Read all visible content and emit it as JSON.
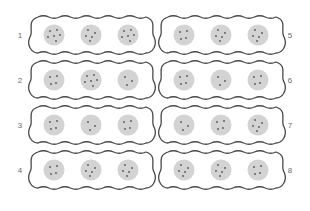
{
  "diagram": {
    "colors": {
      "outline": "#4a4a4a",
      "circle_fill": "#d3d3d3",
      "dot": "#555555",
      "label": "#6b6b6b"
    },
    "groups": [
      {
        "label": "1",
        "column": "left",
        "row": 0,
        "label_side": "left",
        "dot_counts": [
          6,
          5,
          6
        ]
      },
      {
        "label": "2",
        "column": "left",
        "row": 1,
        "label_side": "left",
        "dot_counts": [
          4,
          6,
          3
        ]
      },
      {
        "label": "3",
        "column": "left",
        "row": 2,
        "label_side": "left",
        "dot_counts": [
          4,
          3,
          4
        ]
      },
      {
        "label": "4",
        "column": "left",
        "row": 3,
        "label_side": "left",
        "dot_counts": [
          4,
          5,
          5
        ]
      },
      {
        "label": "5",
        "column": "right",
        "row": 0,
        "label_side": "right",
        "dot_counts": [
          4,
          5,
          5
        ]
      },
      {
        "label": "6",
        "column": "right",
        "row": 1,
        "label_side": "right",
        "dot_counts": [
          4,
          3,
          4
        ]
      },
      {
        "label": "7",
        "column": "right",
        "row": 2,
        "label_side": "right",
        "dot_counts": [
          3,
          4,
          5
        ]
      },
      {
        "label": "8",
        "column": "right",
        "row": 3,
        "label_side": "right",
        "dot_counts": [
          5,
          5,
          4
        ]
      }
    ]
  }
}
